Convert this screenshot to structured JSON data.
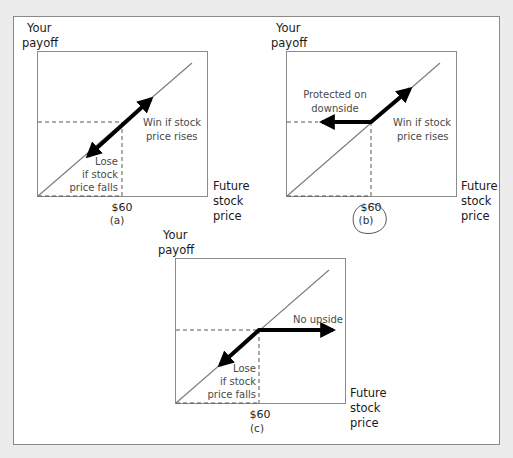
{
  "figure": {
    "panels": [
      {
        "id": "a",
        "caption": "(a)",
        "y_axis_label": [
          "Your",
          "payoff"
        ],
        "x_axis_label": [
          "Future",
          "stock",
          "price"
        ],
        "strike_label": "$60",
        "annotations": {
          "upper": [
            "Win if stock",
            "price rises"
          ],
          "lower": [
            "Lose",
            "if stock",
            "price falls"
          ]
        }
      },
      {
        "id": "b",
        "caption": "(b)",
        "y_axis_label": [
          "Your",
          "payoff"
        ],
        "x_axis_label": [
          "Future",
          "stock",
          "price"
        ],
        "strike_label": "$60",
        "circled": true,
        "annotations": {
          "left": [
            "Protected on",
            "downside"
          ],
          "right": [
            "Win if stock",
            "price rises"
          ]
        }
      },
      {
        "id": "c",
        "caption": "(c)",
        "y_axis_label": [
          "Your",
          "payoff"
        ],
        "x_axis_label": [
          "Future",
          "stock",
          "price"
        ],
        "strike_label": "$60",
        "annotations": {
          "right": [
            "No upside"
          ],
          "lower": [
            "Lose",
            "if stock",
            "price falls"
          ]
        }
      }
    ]
  },
  "colors": {
    "background": "#ececec",
    "frame": "#ffffff",
    "line": "#7a7a7a",
    "arrow": "#000000",
    "dash": "#555555",
    "circle": "#444444"
  }
}
